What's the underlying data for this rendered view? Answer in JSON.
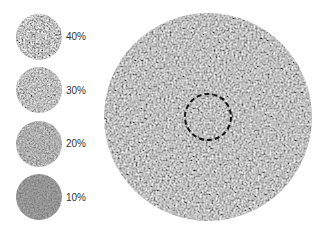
{
  "legend": {
    "items": [
      {
        "label": "40%",
        "contrast": 0.4
      },
      {
        "label": "30%",
        "contrast": 0.3
      },
      {
        "label": "20%",
        "contrast": 0.2
      },
      {
        "label": "10%",
        "contrast": 0.1
      }
    ]
  },
  "main_stimulus": {
    "description": "large noise-texture disc with dashed central target region",
    "target_outline": "dashed circle"
  },
  "colors": {
    "background": "#ffffff",
    "texture_mid": "#8a8a8a",
    "texture_dark": "#4a4a4a",
    "texture_light": "#b0b0b0",
    "dash": "#111111"
  }
}
